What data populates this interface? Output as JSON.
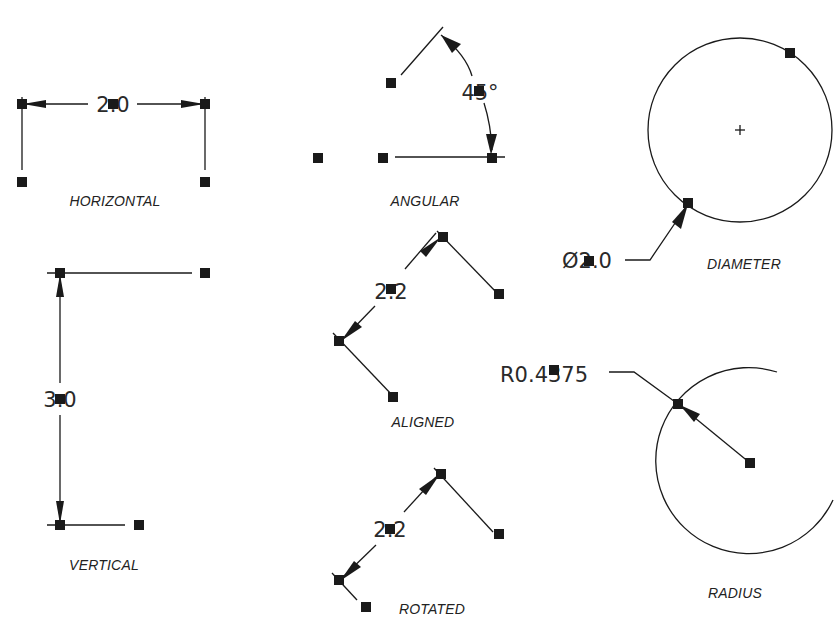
{
  "diagram": {
    "colors": {
      "line": "#1a1a1a",
      "grip": "#1a1a1a",
      "background": "#ffffff"
    },
    "panels": [
      {
        "id": "horizontal",
        "label": "HORIZONTAL",
        "dim_text": "2.0"
      },
      {
        "id": "angular",
        "label": "ANGULAR",
        "dim_text": "45°"
      },
      {
        "id": "diameter",
        "label": "DIAMETER",
        "dim_text": "Ø2.0"
      },
      {
        "id": "vertical",
        "label": "VERTICAL",
        "dim_text": "3.0"
      },
      {
        "id": "aligned",
        "label": "ALIGNED",
        "dim_text": "2.2"
      },
      {
        "id": "rotated",
        "label": "ROTATED",
        "dim_text": "2.2"
      },
      {
        "id": "radius",
        "label": "RADIUS",
        "dim_text": "R0.4375"
      }
    ]
  }
}
